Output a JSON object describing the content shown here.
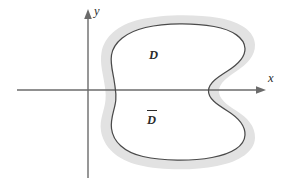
{
  "figure": {
    "background_color": "#ffffff"
  },
  "axes": {
    "x_axis": {
      "label": "x",
      "color": "#6b6b6b",
      "start_x": 17,
      "end_x": 266,
      "y": 90,
      "arrow": "right-arrow-head"
    },
    "y_axis": {
      "label": "y",
      "color": "#6b6b6b",
      "x": 88,
      "start_y": 178,
      "end_y": 9,
      "arrow": "up-arrow-head"
    },
    "origin": {
      "x": 88,
      "y": 90
    }
  },
  "regions": {
    "interior": {
      "label": "D",
      "description": "open region interior, white fill",
      "fill_color": "#ffffff",
      "label_x": 149,
      "label_y": 49
    },
    "closure": {
      "label": "D",
      "overbar": true,
      "description": "closure of D, gray band surrounding the boundary curve",
      "fill_color": "#e2e2e2",
      "label_x": 147,
      "label_y": 110
    },
    "boundary_curve": {
      "stroke_color": "#4a4a4a",
      "stroke_width": 1.25,
      "description": "closed kidney-shaped curve with concave indentation on the right side"
    }
  },
  "labels": {
    "x": "x",
    "y": "y",
    "d": "D",
    "d_closure": "D"
  }
}
